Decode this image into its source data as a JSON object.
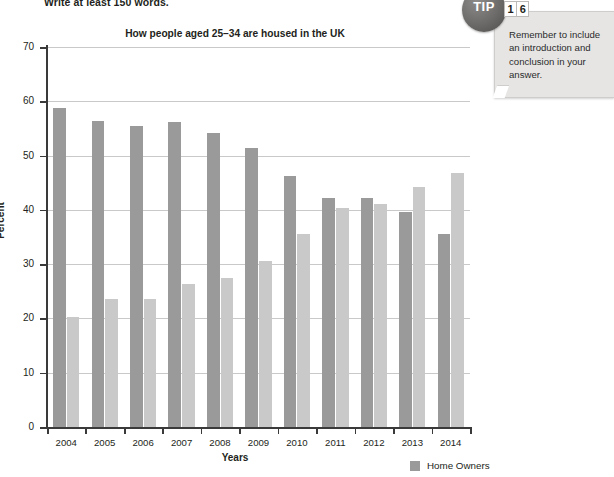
{
  "worksheet": {
    "instruction": "Write at least 150 words."
  },
  "tip": {
    "badge_label": "TIP",
    "number_digits": [
      "1",
      "6"
    ],
    "text": "Remember to include an introduction and conclusion in your answer."
  },
  "legend": {
    "entries": [
      {
        "label": "Home Owners",
        "color": "#9a9a9a"
      }
    ]
  },
  "chart_data": {
    "type": "bar",
    "title": "How people aged 25–34 are housed in the UK",
    "xlabel": "Years",
    "ylabel": "Percent",
    "ylim": [
      0,
      70
    ],
    "ytick_step": 10,
    "yticks": [
      0,
      10,
      20,
      30,
      40,
      50,
      60,
      70
    ],
    "grid": true,
    "legend_position": "bottom-right",
    "categories": [
      "2004",
      "2005",
      "2006",
      "2007",
      "2008",
      "2009",
      "2010",
      "2011",
      "2012",
      "2013",
      "2014"
    ],
    "series": [
      {
        "name": "Home Owners",
        "color": "#9a9a9a",
        "values": [
          58.7,
          56.3,
          55.5,
          56.2,
          54.1,
          51.4,
          46.2,
          42.2,
          42.1,
          39.6,
          35.5
        ]
      },
      {
        "name": "Renters",
        "color": "#c9c9c9",
        "values": [
          20.3,
          23.6,
          23.5,
          26.4,
          27.4,
          30.6,
          35.6,
          40.4,
          41.0,
          44.2,
          46.8
        ]
      }
    ]
  }
}
